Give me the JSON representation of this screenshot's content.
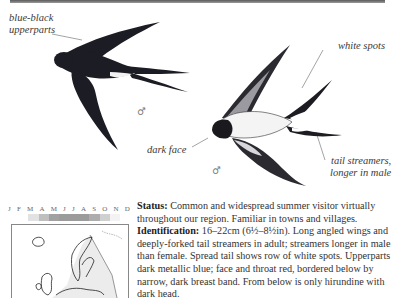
{
  "page": {
    "species": "Barn Swallow",
    "labels": {
      "upperparts": "blue-black upperparts",
      "upperparts_line1": "blue-black",
      "upperparts_line2": "upperparts",
      "white_spots": "white spots",
      "dark_face": "dark face",
      "tail_line1": "tail streamers,",
      "tail_line2": "longer in male"
    },
    "sex_symbol": "♂",
    "calendar": {
      "months": [
        "J",
        "F",
        "M",
        "A",
        "M",
        "J",
        "J",
        "A",
        "S",
        "O",
        "N",
        "D"
      ],
      "presence": [
        0,
        0,
        0.25,
        0.55,
        0.8,
        0.85,
        0.85,
        0.85,
        0.7,
        0.4,
        0.1,
        0
      ],
      "color": "#8a8a8a"
    },
    "map": {
      "region": "Europe",
      "range_color": "#e8e8e8"
    },
    "description": {
      "status_label": "Status:",
      "status_text": " Common and widespread summer visitor virtually throughout our region. Familiar in towns and villages.",
      "id_label": "Identification:",
      "id_text": " 16–22cm (6½–8½in). Long angled wings and deeply-forked tail streamers in adult; streamers longer in male than female. Spread tail shows row of white spots. Upperparts dark metallic blue; face and throat red, bordered below by narrow, dark breast band. From below is only hirundine with dark head."
    }
  }
}
